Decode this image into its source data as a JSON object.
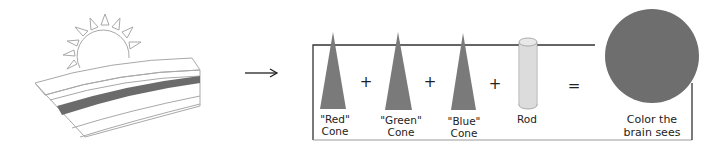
{
  "diagram": {
    "colors": {
      "cone_fill": "#7a7a7a",
      "rod_fill": "#dcdcdc",
      "result_circle": "#6e6e6e",
      "box_stroke": "#333333",
      "sun_stroke": "#a0a0a0",
      "rainbow_band": "#6b6b6b"
    },
    "components": [
      {
        "id": "red-cone",
        "type": "cone",
        "line1": "\"Red\"",
        "line2": "Cone"
      },
      {
        "id": "green-cone",
        "type": "cone",
        "line1": "\"Green\"",
        "line2": "Cone"
      },
      {
        "id": "blue-cone",
        "type": "cone",
        "line1": "\"Blue\"",
        "line2": "Cone"
      },
      {
        "id": "rod",
        "type": "rod",
        "line1": "Rod",
        "line2": ""
      }
    ],
    "operators": {
      "plus": "+",
      "equals": "="
    },
    "result": {
      "line1": "Color the",
      "line2": "brain sees"
    },
    "input_icon": "sun-over-field-icon",
    "arrow_icon": "right-arrow-icon"
  }
}
